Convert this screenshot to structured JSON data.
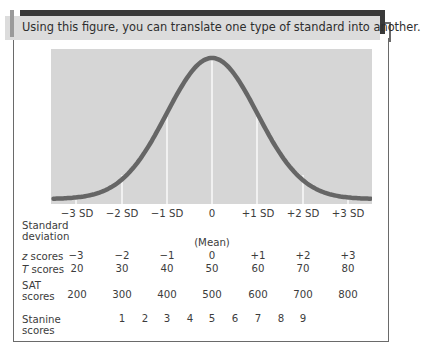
{
  "caption": "Using this figure, you can translate one type of standard into another.",
  "chart_data": {
    "type": "line",
    "title": "Using this figure, you can translate one type of standard into another.",
    "subtitle": "Normal distribution with standard score equivalents",
    "x": [
      -3,
      -2,
      -1,
      0,
      1,
      2,
      3
    ],
    "series": [
      {
        "name": "Normal curve (relative density)",
        "values": [
          0.011,
          0.135,
          0.607,
          1.0,
          0.607,
          0.135,
          0.011
        ]
      }
    ],
    "xlabel": "Standard deviation",
    "ylabel": "",
    "xlim": [
      -3.5,
      3.5
    ],
    "grid": false,
    "vertical_lines_at": [
      -3,
      -2,
      -1,
      0,
      1,
      2,
      3
    ],
    "tick_labels": [
      "−3 SD",
      "−2 SD",
      "−1 SD",
      "0",
      "+1 SD",
      "+2 SD",
      "+3 SD"
    ],
    "annotations": [
      "(Mean)"
    ],
    "score_scales": {
      "z_scores": [
        "−3",
        "−2",
        "−1",
        "0",
        "+1",
        "+2",
        "+3"
      ],
      "T_scores": [
        20,
        30,
        40,
        50,
        60,
        70,
        80
      ],
      "SAT_scores": [
        200,
        300,
        400,
        500,
        600,
        700,
        800
      ],
      "Stanine_scores": [
        1,
        2,
        3,
        4,
        5,
        6,
        7,
        8,
        9
      ]
    },
    "colors": {
      "curve": "#666666",
      "background": "#d6d6d6",
      "lines": "#ffffff"
    }
  },
  "axis": {
    "sd_labels": [
      "−3 SD",
      "−2 SD",
      "−1 SD",
      "0",
      "+1 SD",
      "+2 SD",
      "+3 SD"
    ],
    "mean_label": "(Mean)"
  },
  "rows": {
    "sd": {
      "label_line1": "Standard",
      "label_line2": "deviation"
    },
    "z": {
      "label_italic": "z",
      "label_rest": " scores",
      "values": [
        "−3",
        "−2",
        "−1",
        "0",
        "+1",
        "+2",
        "+3"
      ]
    },
    "t": {
      "label_italic": "T",
      "label_rest": " scores",
      "values": [
        "20",
        "30",
        "40",
        "50",
        "60",
        "70",
        "80"
      ]
    },
    "sat": {
      "label_line1": "SAT",
      "label_line2": "scores",
      "values": [
        "200",
        "300",
        "400",
        "500",
        "600",
        "700",
        "800"
      ]
    },
    "stanine": {
      "label_line1": "Stanine",
      "label_line2": "scores",
      "values": [
        "1",
        "2",
        "3",
        "4",
        "5",
        "6",
        "7",
        "8",
        "9"
      ]
    }
  }
}
